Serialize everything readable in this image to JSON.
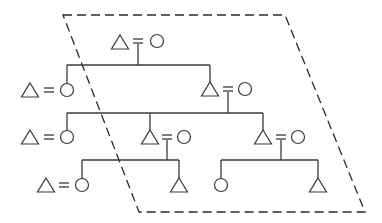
{
  "diagram": {
    "type": "pedigree-chart",
    "title": "",
    "legend": {
      "male": "triangle",
      "female": "circle",
      "marriage": "double-line (=)",
      "boundary": "dashed parallelogram"
    },
    "stroke_color": "#3a3a3a",
    "boundary_color": "#2a2a2a",
    "generations": [
      {
        "level": 1,
        "couples": [
          {
            "id": "g1-couple",
            "members": [
              "male",
              "female"
            ],
            "married": true,
            "has_children": true
          }
        ]
      },
      {
        "level": 2,
        "individuals": [
          {
            "id": "g2-left",
            "sex": "female",
            "spouse": "male (married-in)",
            "parents": "g1-couple"
          },
          {
            "id": "g2-right",
            "sex": "male",
            "spouse": "female (married-in)",
            "parents": "g1-couple",
            "has_children": true
          }
        ]
      },
      {
        "level": 3,
        "individuals": [
          {
            "id": "g3-left",
            "sex": "female",
            "spouse": "male (married-in)",
            "parents": "g2-right"
          },
          {
            "id": "g3-middle",
            "sex": "male",
            "spouse": "female (married-in)",
            "parents": "g2-right",
            "has_children": true
          },
          {
            "id": "g3-right",
            "sex": "male",
            "spouse": "female (married-in)",
            "parents": "g2-right",
            "has_children": true
          }
        ]
      },
      {
        "level": 4,
        "individuals": [
          {
            "id": "g4-a",
            "sex": "female",
            "spouse": "male (married-in)",
            "parents": "g3-middle"
          },
          {
            "id": "g4-b",
            "sex": "male",
            "parents": "g3-middle"
          },
          {
            "id": "g4-c",
            "sex": "female",
            "parents": "g3-right"
          },
          {
            "id": "g4-d",
            "sex": "male",
            "parents": "g3-right"
          }
        ]
      }
    ]
  }
}
